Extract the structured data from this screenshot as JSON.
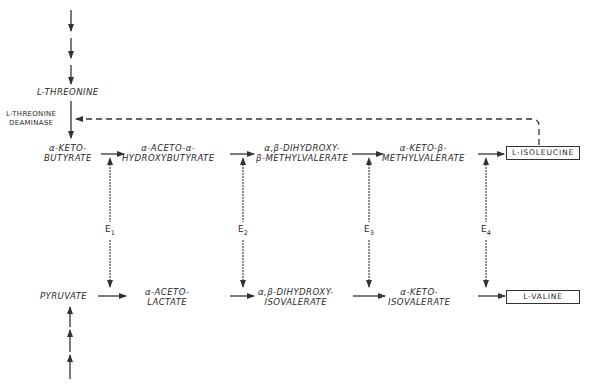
{
  "diagram": {
    "top_input": {
      "label": "L-THREONINE"
    },
    "enzyme_label": {
      "line1": "L-THREONINE",
      "line2": "DEAMINASE"
    },
    "isoleucine_pathway": [
      {
        "id": "aketobutyrate",
        "line1": "α-KETO-",
        "line2": "BUTYRATE"
      },
      {
        "id": "aacetoahb",
        "line1": "α-ACETO-α-",
        "line2": "HYDROXYBUTYRATE"
      },
      {
        "id": "dhmv",
        "line1": "α,β-DIHYDROXY-",
        "line2": "β-METHYLVALERATE"
      },
      {
        "id": "akmv",
        "line1": "α-KETO-β-",
        "line2": "METHYLVALERATE"
      }
    ],
    "isoleucine_product": "L-ISOLEUCINE",
    "valine_pathway": [
      {
        "id": "pyruvate",
        "line1": "PYRUVATE",
        "line2": ""
      },
      {
        "id": "aacetolactate",
        "line1": "α-ACETO-",
        "line2": "LACTATE"
      },
      {
        "id": "dhiv",
        "line1": "α,β-DIHYDROXY-",
        "line2": "ISOVALERATE"
      },
      {
        "id": "akiv",
        "line1": "α-KETO-",
        "line2": "ISOVALERATE"
      }
    ],
    "valine_product": "L-VALINE",
    "enzymes": [
      {
        "name": "E",
        "sub": "1"
      },
      {
        "name": "E",
        "sub": "2"
      },
      {
        "name": "E",
        "sub": "3"
      },
      {
        "name": "E",
        "sub": "4"
      }
    ],
    "feedback": {
      "from": "L-ISOLEUCINE",
      "to": "L-THREONINE DEAMINASE",
      "style": "dashed"
    }
  },
  "colors": {
    "line": "#333333",
    "background": "#ffffff"
  }
}
